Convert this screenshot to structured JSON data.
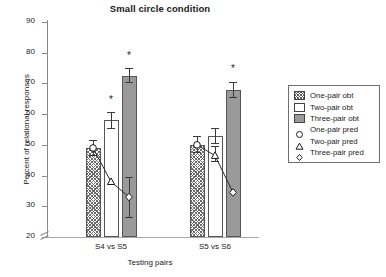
{
  "chart_data": {
    "type": "bar",
    "title": "Small circle condition",
    "xlabel": "Testing pairs",
    "ylabel": "Percent of relational responses",
    "categories": [
      "S4 vs S5",
      "S5 vs S6"
    ],
    "ylim": [
      20,
      90
    ],
    "yticks": [
      20,
      30,
      40,
      50,
      60,
      70,
      80,
      90
    ],
    "axis_break": true,
    "grid": false,
    "legend_position": "right",
    "series": [
      {
        "name": "One-pair obt",
        "kind": "bar",
        "style": "hatched",
        "values": [
          49.0,
          50.0
        ],
        "errors": [
          2.5,
          2.8
        ]
      },
      {
        "name": "Two-pair obt",
        "kind": "bar",
        "style": "white",
        "values": [
          58.0,
          53.0
        ],
        "errors": [
          2.8,
          2.6
        ]
      },
      {
        "name": "Three-pair obt",
        "kind": "bar",
        "style": "gray",
        "values": [
          72.5,
          68.0
        ],
        "errors": [
          2.4,
          2.6
        ]
      },
      {
        "name": "One-pair pred",
        "kind": "marker",
        "style": "circle",
        "values": [
          49.0,
          50.0
        ]
      },
      {
        "name": "Two-pair pred",
        "kind": "marker",
        "style": "triangle",
        "values": [
          38.0,
          46.5
        ]
      },
      {
        "name": "Three-pair pred",
        "kind": "marker",
        "style": "diamond",
        "values": [
          33.0,
          34.5
        ]
      }
    ],
    "annotations": [
      {
        "label": "*",
        "group": "S4 vs S5",
        "series": "Two-pair obt",
        "y": 64.5
      },
      {
        "label": "*",
        "group": "S4 vs S5",
        "series": "Three-pair obt",
        "y": 79.0
      },
      {
        "label": "*",
        "group": "S5 vs S6",
        "series": "Three-pair obt",
        "y": 74.8
      }
    ],
    "extra_ranges": [
      {
        "group": "S4 vs S5",
        "series": "Three-pair pred",
        "low": 26.3,
        "high": 39.5
      },
      {
        "group": "S5 vs S6",
        "series": "Two-pair pred",
        "low": 44.5,
        "high": 49.5
      }
    ]
  },
  "axis": {
    "ytick_labels": [
      "90",
      "80",
      "70",
      "60",
      "50",
      "40",
      "30",
      "20"
    ],
    "xtick_labels": [
      "S4 vs S5",
      "S5 vs S6"
    ]
  },
  "legend": {
    "items": [
      {
        "label": "One-pair obt",
        "swatch": "hatched-square-icon"
      },
      {
        "label": "Two-pair obt",
        "swatch": "white-square-icon"
      },
      {
        "label": "Three-pair obt",
        "swatch": "gray-square-icon"
      },
      {
        "label": "One-pair pred",
        "swatch": "circle-marker-icon"
      },
      {
        "label": "Two-pair pred",
        "swatch": "triangle-marker-icon"
      },
      {
        "label": "Three-pair pred",
        "swatch": "diamond-marker-icon"
      }
    ]
  },
  "colors": {
    "bar_gray": "#9a9a9a",
    "bar_outline": "#555555",
    "axis": "#8a8a8a",
    "text": "#1a1a1a"
  }
}
